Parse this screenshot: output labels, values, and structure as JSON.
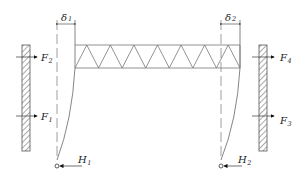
{
  "diagram": {
    "colors": {
      "line": "#777777",
      "dark": "#222222",
      "background": "#ffffff"
    },
    "labels": {
      "delta1": {
        "symbol": "δ",
        "sub": "1"
      },
      "delta2": {
        "symbol": "δ",
        "sub": "2"
      },
      "F1": {
        "symbol": "F",
        "sub": "1"
      },
      "F2": {
        "symbol": "F",
        "sub": "2"
      },
      "F3": {
        "symbol": "F",
        "sub": "3"
      },
      "F4": {
        "symbol": "F",
        "sub": "4"
      },
      "H1": {
        "symbol": "H",
        "sub": "1"
      },
      "H2": {
        "symbol": "H",
        "sub": "2"
      }
    }
  }
}
